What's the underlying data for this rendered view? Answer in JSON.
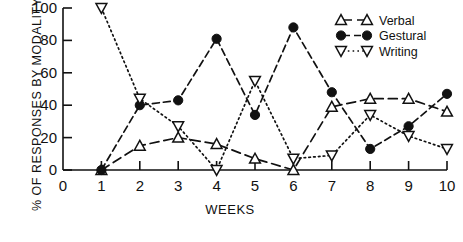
{
  "chart_data": {
    "type": "line",
    "title": "",
    "xlabel": "WEEKS",
    "ylabel": "% OF RESPONSES BY MODALITY",
    "x": [
      1,
      2,
      3,
      4,
      5,
      6,
      7,
      8,
      9,
      10
    ],
    "xticklabels": [
      "0",
      "1",
      "2",
      "3",
      "4",
      "5",
      "6",
      "7",
      "8",
      "9",
      "10"
    ],
    "xticks": [
      0,
      1,
      2,
      3,
      4,
      5,
      6,
      7,
      8,
      9,
      10
    ],
    "xlim": [
      0,
      10
    ],
    "ylim": [
      0,
      100
    ],
    "yticks": [
      0,
      20,
      40,
      60,
      80,
      100
    ],
    "yticklabels": [
      "0",
      "20",
      "40",
      "60",
      "80",
      "100"
    ],
    "grid": false,
    "legend_position": "top-right",
    "series": [
      {
        "name": "Verbal",
        "marker": "triangle-up-open",
        "linestyle": "dashed",
        "color": "#111111",
        "values": [
          0,
          15,
          20,
          16,
          7,
          0,
          39,
          44,
          44,
          36
        ]
      },
      {
        "name": "Gestural",
        "marker": "circle-filled",
        "linestyle": "dash-dot",
        "color": "#111111",
        "values": [
          0,
          40,
          43,
          81,
          34,
          88,
          48,
          13,
          27,
          47
        ]
      },
      {
        "name": "Writing",
        "marker": "triangle-down-open",
        "linestyle": "dotted",
        "color": "#111111",
        "values": [
          100,
          44,
          27,
          0,
          55,
          7,
          9,
          34,
          21,
          13
        ]
      }
    ]
  },
  "legend": {
    "items": [
      {
        "label": "Verbal"
      },
      {
        "label": "Gestural"
      },
      {
        "label": "Writing"
      }
    ]
  }
}
